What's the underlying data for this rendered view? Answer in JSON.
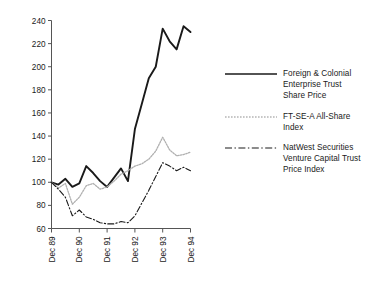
{
  "chart_data": {
    "type": "line",
    "title": "",
    "subtitle": "",
    "xlabel": "",
    "ylabel": "",
    "x": [
      "Dec 89",
      "Mar 90",
      "Jun 90",
      "Sep 90",
      "Dec 90",
      "Mar 91",
      "Jun 91",
      "Sep 91",
      "Dec 91",
      "Mar 92",
      "Jun 92",
      "Sep 92",
      "Dec 92",
      "Mar 93",
      "Jun 93",
      "Sep 93",
      "Dec 93",
      "Mar 94",
      "Jun 94",
      "Sep 94",
      "Dec 94"
    ],
    "xtick_labels": [
      "Dec 89",
      "Dec 90",
      "Dec 91",
      "Dec 92",
      "Dec 93",
      "Dec 94"
    ],
    "xtick_index": [
      0,
      4,
      8,
      12,
      16,
      20
    ],
    "ytick_labels": [
      "60",
      "80",
      "100",
      "120",
      "140",
      "160",
      "180",
      "200",
      "220",
      "240"
    ],
    "ytick_values": [
      60,
      80,
      100,
      120,
      140,
      160,
      180,
      200,
      220,
      240
    ],
    "xlim": [
      0,
      20
    ],
    "ylim": [
      60,
      240
    ],
    "grid": false,
    "legend_position": "right",
    "series": [
      {
        "name": "Foreign & Colonial Enterprise Trust Share Price",
        "style": "solid",
        "color": "#1a1a1a",
        "values": [
          100,
          98,
          103,
          96,
          99,
          114,
          108,
          101,
          96,
          104,
          112,
          101,
          146,
          168,
          190,
          200,
          233,
          222,
          215,
          235,
          230
        ]
      },
      {
        "name": "FT-SE-A All-Share Index",
        "style": "dotted",
        "color": "#b0b0b0",
        "values": [
          100,
          95,
          99,
          81,
          87,
          97,
          99,
          94,
          96,
          101,
          107,
          110,
          114,
          116,
          120,
          127,
          139,
          128,
          123,
          124,
          126
        ]
      },
      {
        "name": "NatWest Securities Venture Capital Trust Price Index",
        "style": "dashdot",
        "color": "#1a1a1a",
        "values": [
          100,
          94,
          87,
          71,
          76,
          70,
          68,
          65,
          64,
          64,
          66,
          65,
          71,
          82,
          93,
          105,
          117,
          114,
          110,
          113,
          110
        ]
      }
    ]
  },
  "legend": {
    "items": [
      {
        "label": "Foreign & Colonial\nEnterprise Trust\nShare Price",
        "style": "solid"
      },
      {
        "label": "FT-SE-A All-Share\nIndex",
        "style": "dotted"
      },
      {
        "label": "NatWest Securities\nVenture Capital Trust\nPrice Index",
        "style": "dashdot"
      }
    ]
  }
}
